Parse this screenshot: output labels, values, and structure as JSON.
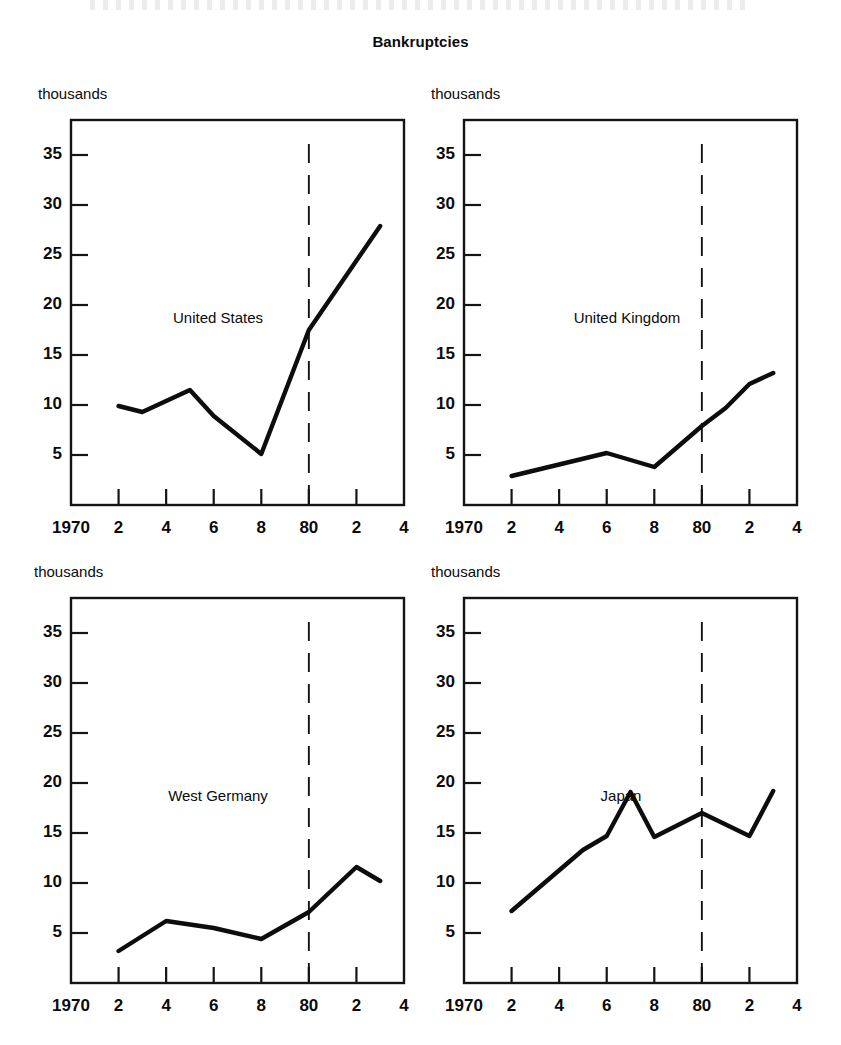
{
  "title": "Bankruptcies",
  "unit_label": "thousands",
  "axis": {
    "y_ticks": [
      5,
      10,
      15,
      20,
      25,
      30,
      35
    ],
    "y_tick_labels": [
      "5",
      "10",
      "15",
      "20",
      "25",
      "30",
      "35"
    ],
    "ylim": [
      0,
      38.5
    ],
    "x_ticks": [
      1970,
      1972,
      1974,
      1976,
      1978,
      1980,
      1982,
      1984
    ],
    "x_tick_labels": [
      "1970",
      "2",
      "4",
      "6",
      "8",
      "80",
      "2",
      "4"
    ],
    "xlim": [
      1970,
      1984
    ],
    "divider_year": 1980
  },
  "chart_data": {
    "type": "line",
    "title": "Bankruptcies",
    "xlabel": "",
    "ylabel": "thousands",
    "ylim": [
      0,
      38.5
    ],
    "xlim": [
      1970,
      1984
    ],
    "grid": false,
    "legend": "none",
    "annotations": [
      {
        "type": "vertical-dashed-line",
        "x": 1980,
        "label": "80"
      }
    ],
    "panels": [
      {
        "name": "United States",
        "x": [
          1972,
          1973,
          1975,
          1976,
          1978,
          1980,
          1983
        ],
        "values": [
          9.9,
          9.3,
          11.5,
          8.9,
          5.1,
          17.5,
          27.9
        ]
      },
      {
        "name": "United Kingdom",
        "x": [
          1972,
          1976,
          1978,
          1980,
          1981,
          1982,
          1983
        ],
        "values": [
          2.9,
          5.2,
          3.8,
          7.9,
          9.7,
          12.1,
          13.2
        ]
      },
      {
        "name": "West Germany",
        "x": [
          1972,
          1974,
          1976,
          1978,
          1980,
          1982,
          1983
        ],
        "values": [
          3.2,
          6.2,
          5.5,
          4.4,
          7.1,
          11.6,
          10.2
        ]
      },
      {
        "name": "Japan",
        "x": [
          1972,
          1975,
          1976,
          1977,
          1978,
          1980,
          1982,
          1983
        ],
        "values": [
          7.2,
          13.3,
          14.7,
          19.1,
          14.6,
          17.0,
          14.7,
          19.2
        ]
      }
    ]
  }
}
